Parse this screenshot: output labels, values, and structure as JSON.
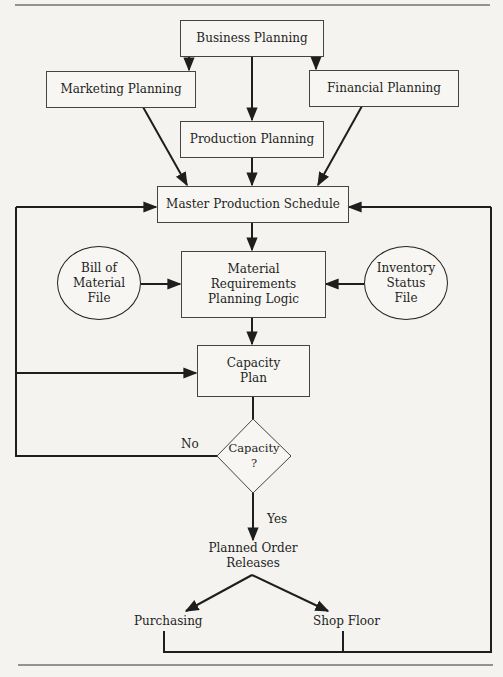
{
  "diagram": {
    "nodes": {
      "business_planning": "Business Planning",
      "marketing_planning": "Marketing Planning",
      "financial_planning": "Financial Planning",
      "production_planning": "Production Planning",
      "master_production_schedule": "Master Production Schedule",
      "bill_of_material_file": "Bill of\nMaterial\nFile",
      "mrp_logic": "Material\nRequirements\nPlanning Logic",
      "inventory_status_file": "Inventory\nStatus\nFile",
      "capacity_plan": "Capacity\nPlan",
      "capacity_decision": "Capacity\n?",
      "planned_order_releases": "Planned Order\nReleases",
      "purchasing": "Purchasing",
      "shop_floor": "Shop Floor"
    },
    "edge_labels": {
      "no": "No",
      "yes": "Yes"
    },
    "edges": [
      {
        "from": "Business Planning",
        "to": "Marketing Planning"
      },
      {
        "from": "Business Planning",
        "to": "Financial Planning"
      },
      {
        "from": "Business Planning",
        "to": "Production Planning"
      },
      {
        "from": "Marketing Planning",
        "to": "Master Production Schedule"
      },
      {
        "from": "Production Planning",
        "to": "Master Production Schedule"
      },
      {
        "from": "Financial Planning",
        "to": "Master Production Schedule"
      },
      {
        "from": "Master Production Schedule",
        "to": "Material Requirements Planning Logic"
      },
      {
        "from": "Bill of Material File",
        "to": "Material Requirements Planning Logic"
      },
      {
        "from": "Inventory Status File",
        "to": "Material Requirements Planning Logic"
      },
      {
        "from": "Material Requirements Planning Logic",
        "to": "Capacity Plan"
      },
      {
        "from": "Capacity Plan",
        "to": "Capacity ?"
      },
      {
        "from": "Capacity ?",
        "to": "Master Production Schedule",
        "label": "No"
      },
      {
        "from": "Capacity ?",
        "to": "Capacity Plan",
        "label": "No"
      },
      {
        "from": "Capacity ?",
        "to": "Planned Order Releases",
        "label": "Yes"
      },
      {
        "from": "Planned Order Releases",
        "to": "Purchasing"
      },
      {
        "from": "Planned Order Releases",
        "to": "Shop Floor"
      },
      {
        "from": "Purchasing",
        "to": "Master Production Schedule"
      },
      {
        "from": "Shop Floor",
        "to": "Master Production Schedule"
      }
    ]
  }
}
